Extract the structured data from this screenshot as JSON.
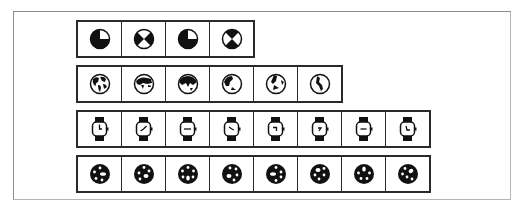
{
  "rows": [
    {
      "name": "beachball-spinner-frames",
      "frames": [
        "beachball-0",
        "beachball-1",
        "beachball-2",
        "beachball-3"
      ]
    },
    {
      "name": "spinning-globe-frames",
      "frames": [
        "globe-0",
        "globe-1",
        "globe-2",
        "globe-3",
        "globe-4",
        "globe-5"
      ]
    },
    {
      "name": "watch-cursor-frames",
      "frames": [
        "watch-0",
        "watch-1",
        "watch-2",
        "watch-3",
        "watch-4",
        "watch-5",
        "watch-6",
        "watch-7"
      ]
    },
    {
      "name": "ball-spinner-frames",
      "frames": [
        "ball-0",
        "ball-1",
        "ball-2",
        "ball-3",
        "ball-4",
        "ball-5",
        "ball-6",
        "ball-7"
      ]
    }
  ],
  "colors": {
    "ink": "#111111",
    "border": "#2a2a2a",
    "frame": "#8c8c8c",
    "background": "#ffffff"
  }
}
